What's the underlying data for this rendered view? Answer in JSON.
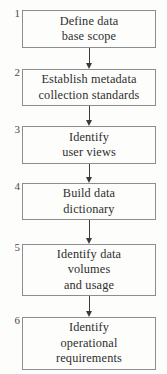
{
  "figure": {
    "type": "vertical-flowchart",
    "orientation": "top-to-bottom",
    "background_color": "#fdfdfb",
    "line_color": "#8d8d8d",
    "text_color": "#2e2e2e",
    "steps": [
      {
        "number": "1",
        "lines": [
          "Define data",
          "base scope"
        ],
        "box": {
          "x": 22,
          "y": 10,
          "width": 134,
          "height": 38
        }
      },
      {
        "number": "2",
        "lines": [
          "Establish metadata",
          "collection standards"
        ],
        "box": {
          "x": 22,
          "y": 69,
          "width": 134,
          "height": 37
        }
      },
      {
        "number": "3",
        "lines": [
          "Identify",
          "user views"
        ],
        "box": {
          "x": 22,
          "y": 126,
          "width": 134,
          "height": 38
        }
      },
      {
        "number": "4",
        "lines": [
          "Build data",
          "dictionary"
        ],
        "box": {
          "x": 22,
          "y": 183,
          "width": 134,
          "height": 37
        }
      },
      {
        "number": "5",
        "lines": [
          "Identify data",
          "volumes",
          "and usage"
        ],
        "box": {
          "x": 22,
          "y": 244,
          "width": 134,
          "height": 52
        }
      },
      {
        "number": "6",
        "lines": [
          "Identify",
          "operational",
          "requirements"
        ],
        "box": {
          "x": 22,
          "y": 317,
          "width": 134,
          "height": 53
        }
      }
    ],
    "connectors": [
      {
        "from": "1",
        "to": "2",
        "x": 89,
        "y": 48,
        "length": 21
      },
      {
        "from": "2",
        "to": "3",
        "x": 89,
        "y": 106,
        "length": 20
      },
      {
        "from": "3",
        "to": "4",
        "x": 89,
        "y": 164,
        "length": 19
      },
      {
        "from": "4",
        "to": "5",
        "x": 89,
        "y": 220,
        "length": 24
      },
      {
        "from": "5",
        "to": "6",
        "x": 89,
        "y": 296,
        "length": 21
      }
    ]
  }
}
